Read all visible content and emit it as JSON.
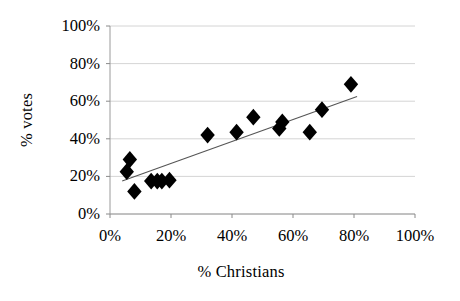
{
  "chart_data": {
    "type": "scatter",
    "title": "",
    "subtitle": "",
    "xlabel": "% Christians",
    "ylabel": "% votes",
    "xlim": [
      0,
      100
    ],
    "ylim": [
      0,
      100
    ],
    "xticks": [
      "0%",
      "20%",
      "40%",
      "60%",
      "80%",
      "100%"
    ],
    "xtick_values": [
      0,
      20,
      40,
      60,
      80,
      100
    ],
    "yticks": [
      "0%",
      "20%",
      "40%",
      "60%",
      "80%",
      "100%"
    ],
    "ytick_values": [
      0,
      20,
      40,
      60,
      80,
      100
    ],
    "grid": "horizontal",
    "legend": "none",
    "marker": "diamond",
    "marker_color": "#000000",
    "trendline_color": "#555555",
    "points": [
      {
        "x": 5.5,
        "y": 22.5
      },
      {
        "x": 6.5,
        "y": 29.0
      },
      {
        "x": 8.0,
        "y": 12.0
      },
      {
        "x": 13.5,
        "y": 17.5
      },
      {
        "x": 15.5,
        "y": 17.5
      },
      {
        "x": 17.0,
        "y": 17.5
      },
      {
        "x": 19.5,
        "y": 18.0
      },
      {
        "x": 32.0,
        "y": 42.0
      },
      {
        "x": 41.5,
        "y": 43.5
      },
      {
        "x": 47.0,
        "y": 51.5
      },
      {
        "x": 55.5,
        "y": 45.5
      },
      {
        "x": 56.5,
        "y": 49.0
      },
      {
        "x": 65.5,
        "y": 43.5
      },
      {
        "x": 69.5,
        "y": 55.5
      },
      {
        "x": 79.0,
        "y": 69.0
      }
    ],
    "trendline": {
      "x1": 4.0,
      "y1": 17.5,
      "x2": 81.0,
      "y2": 62.5
    }
  }
}
